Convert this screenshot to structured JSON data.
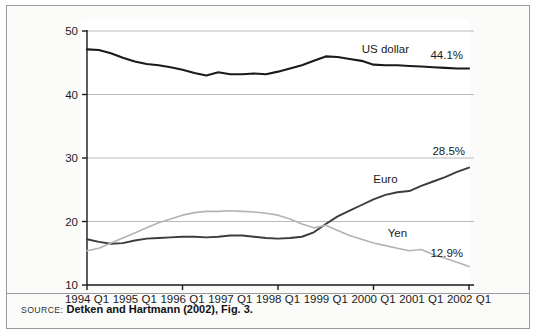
{
  "figure": {
    "source_kicker": "SOURCE:",
    "source_text": "Detken and Hartmann (2002), Fig. 3."
  },
  "chart_data": {
    "type": "line",
    "title": "",
    "xlabel": "",
    "ylabel": "",
    "ylim": [
      10,
      50
    ],
    "xlim": [
      "1994 Q1",
      "2002 Q1"
    ],
    "grid": true,
    "legend": "inline-series-labels",
    "y_ticks": [
      10,
      20,
      30,
      40,
      50
    ],
    "y_tick_labels": [
      "10",
      "20",
      "30",
      "40",
      "50"
    ],
    "x_tick_labels": [
      "1994 Q1",
      "1995 Q1",
      "1996 Q1",
      "1997 Q1",
      "1998 Q1",
      "1999 Q1",
      "2000 Q1",
      "2001 Q1",
      "2002 Q1"
    ],
    "x": [
      "1994 Q1",
      "1994 Q2",
      "1994 Q3",
      "1994 Q4",
      "1995 Q1",
      "1995 Q2",
      "1995 Q3",
      "1995 Q4",
      "1996 Q1",
      "1996 Q2",
      "1996 Q3",
      "1996 Q4",
      "1997 Q1",
      "1997 Q2",
      "1997 Q3",
      "1997 Q4",
      "1998 Q1",
      "1998 Q2",
      "1998 Q3",
      "1998 Q4",
      "1999 Q1",
      "1999 Q2",
      "1999 Q3",
      "1999 Q4",
      "2000 Q1",
      "2000 Q2",
      "2000 Q3",
      "2000 Q4",
      "2001 Q1",
      "2001 Q2",
      "2001 Q3",
      "2001 Q4",
      "2002 Q1"
    ],
    "series": [
      {
        "name": "US dollar",
        "color": "#1a1a1a",
        "end_label": "44.1%",
        "end_value": 44.1,
        "label_x_index": 25,
        "values": [
          47.1,
          47.0,
          46.5,
          45.8,
          45.2,
          44.8,
          44.6,
          44.3,
          43.9,
          43.4,
          43.0,
          43.5,
          43.2,
          43.2,
          43.3,
          43.2,
          43.6,
          44.1,
          44.6,
          45.3,
          46.0,
          45.9,
          45.6,
          45.3,
          44.7,
          44.6,
          44.6,
          44.5,
          44.4,
          44.3,
          44.2,
          44.1,
          44.1
        ]
      },
      {
        "name": "Euro",
        "color": "#3c3c3c",
        "end_label": "28.5%",
        "end_value": 28.5,
        "label_x_index": 25,
        "values": [
          17.2,
          16.8,
          16.5,
          16.6,
          17.0,
          17.3,
          17.4,
          17.5,
          17.6,
          17.6,
          17.5,
          17.6,
          17.8,
          17.8,
          17.6,
          17.4,
          17.3,
          17.4,
          17.6,
          18.3,
          19.6,
          20.8,
          21.7,
          22.6,
          23.5,
          24.2,
          24.6,
          24.8,
          25.6,
          26.3,
          27.0,
          27.8,
          28.5
        ]
      },
      {
        "name": "Yen",
        "color": "#b3b3b3",
        "end_label": "12.9%",
        "end_value": 12.9,
        "label_x_index": 26,
        "values": [
          15.4,
          15.8,
          16.6,
          17.4,
          18.2,
          19.0,
          19.8,
          20.4,
          21.0,
          21.4,
          21.6,
          21.6,
          21.7,
          21.6,
          21.5,
          21.3,
          21.0,
          20.4,
          19.6,
          19.0,
          19.4,
          18.6,
          17.8,
          17.2,
          16.6,
          16.2,
          15.8,
          15.4,
          15.6,
          14.8,
          14.2,
          13.6,
          12.9
        ]
      }
    ]
  }
}
